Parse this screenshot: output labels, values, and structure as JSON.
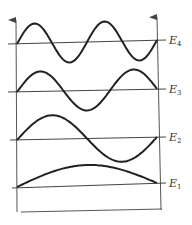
{
  "diagram": {
    "title": "",
    "colors": {
      "line": "#444444",
      "wave": "#222222",
      "background": "#ffffff"
    },
    "levels": [
      {
        "name": "E",
        "subscript": "4",
        "half_wavelengths": 4,
        "baseline_left_y": 44,
        "baseline_right_y": 40,
        "amplitude": 20
      },
      {
        "name": "E",
        "subscript": "3",
        "half_wavelengths": 3,
        "baseline_left_y": 92,
        "baseline_right_y": 89,
        "amplitude": 20
      },
      {
        "name": "E",
        "subscript": "2",
        "half_wavelengths": 2,
        "baseline_left_y": 140,
        "baseline_right_y": 137,
        "amplitude": 24
      },
      {
        "name": "E",
        "subscript": "1",
        "half_wavelengths": 1,
        "baseline_left_y": 187,
        "baseline_right_y": 183,
        "amplitude": 20
      }
    ],
    "labels": {
      "e4": "E",
      "e4_sub": "4",
      "e3": "E",
      "e3_sub": "3",
      "e2": "E",
      "e2_sub": "2",
      "e1": "E",
      "e1_sub": "1"
    }
  }
}
